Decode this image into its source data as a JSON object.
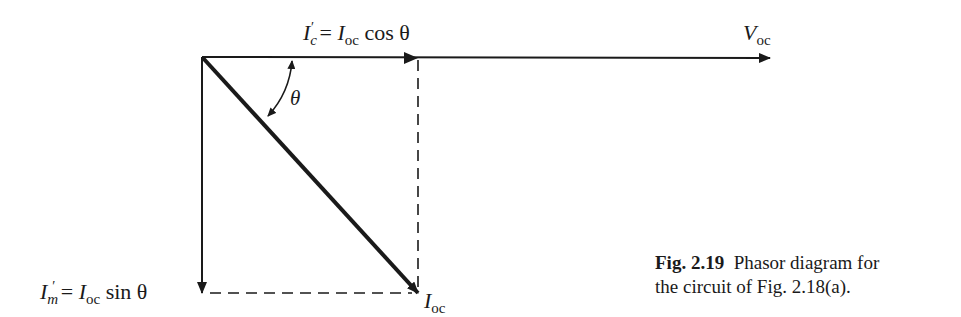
{
  "diagram": {
    "type": "phasor-diagram",
    "labels": {
      "ic": {
        "symbol": "I",
        "sub": "c",
        "prime": "′",
        "eq": " = ",
        "rhs_symbol": "I",
        "rhs_sub": "oc",
        "rhs_func": " cos θ"
      },
      "voc": {
        "symbol": "V",
        "sub": "oc"
      },
      "theta": "θ",
      "im": {
        "symbol": "I",
        "sub": "m",
        "prime": "′",
        "eq": " = ",
        "rhs_symbol": "I",
        "rhs_sub": "oc",
        "rhs_func": " sin θ"
      },
      "ioc": {
        "symbol": "I",
        "sub": "oc"
      }
    },
    "caption": {
      "number": "Fig. 2.19",
      "text_line1": "Phasor diagram for",
      "text_line2": "the circuit of Fig. 2.18(a)."
    },
    "color": "#1a1a1a"
  }
}
